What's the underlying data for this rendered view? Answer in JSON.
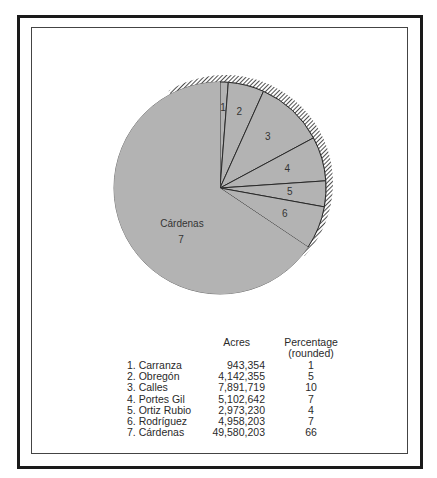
{
  "chart_data": {
    "type": "pie",
    "title": "",
    "start_angle": "top (12 o'clock)",
    "direction": "clockwise",
    "slices": [
      {
        "id": 1,
        "label": "1",
        "name": "Carranza",
        "acres": 943354,
        "percentage": 1
      },
      {
        "id": 2,
        "label": "2",
        "name": "Obregón",
        "acres": 4142355,
        "percentage": 5
      },
      {
        "id": 3,
        "label": "3",
        "name": "Calles",
        "acres": 7891719,
        "percentage": 10
      },
      {
        "id": 4,
        "label": "4",
        "name": "Portes Gil",
        "acres": 5102642,
        "percentage": 7
      },
      {
        "id": 5,
        "label": "5",
        "name": "Ortiz Rubio",
        "acres": 2973230,
        "percentage": 4
      },
      {
        "id": 6,
        "label": "6",
        "name": "Rodríguez",
        "acres": 4958203,
        "percentage": 7
      },
      {
        "id": 7,
        "label": "7",
        "name": "Cárdenas",
        "acres": 49580203,
        "percentage": 66
      }
    ],
    "big_slice_label": "Cárdenas",
    "big_slice_number": "7",
    "colors": {
      "fill": "#b3b3b3",
      "stroke": "#2a2a2a",
      "hatch": "#222222"
    }
  },
  "table": {
    "header_acres": "Acres",
    "header_pct_line1": "Percentage",
    "header_pct_line2": "(rounded)",
    "rows": [
      {
        "name": "1.  Carranza",
        "acres": "943,354",
        "pct": "1"
      },
      {
        "name": "2.  Obregón",
        "acres": "4,142,355",
        "pct": "5"
      },
      {
        "name": "3.  Calles",
        "acres": "7,891,719",
        "pct": "10"
      },
      {
        "name": "4.  Portes Gil",
        "acres": "5,102,642",
        "pct": "7"
      },
      {
        "name": "5.  Ortiz Rubio",
        "acres": "2,973,230",
        "pct": "4"
      },
      {
        "name": "6.  Rodríguez",
        "acres": "4,958,203",
        "pct": "7"
      },
      {
        "name": "7.  Cárdenas",
        "acres": "49,580,203",
        "pct": "66"
      }
    ]
  }
}
